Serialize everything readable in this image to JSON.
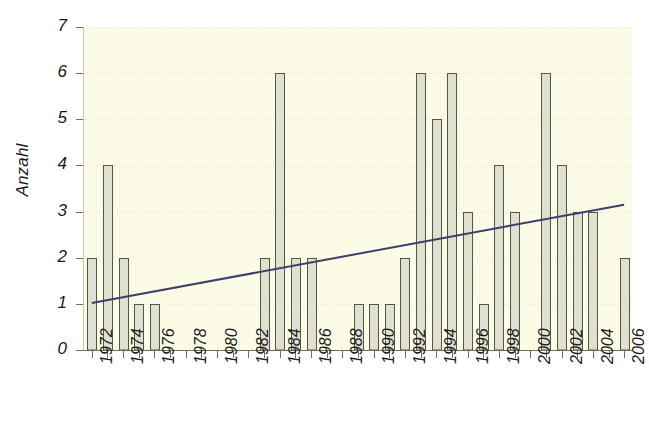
{
  "chart_data": {
    "type": "bar",
    "title": "",
    "subtitle": "",
    "xlabel": "",
    "ylabel": "Anzahl",
    "ylim": [
      0,
      7
    ],
    "xlim": [
      1971.5,
      2006.5
    ],
    "grid": true,
    "legend": false,
    "legend_position": "none",
    "categories": [
      "1972",
      "1973",
      "1974",
      "1975",
      "1976",
      "1977",
      "1978",
      "1979",
      "1980",
      "1981",
      "1982",
      "1983",
      "1984",
      "1985",
      "1986",
      "1987",
      "1988",
      "1989",
      "1990",
      "1991",
      "1992",
      "1993",
      "1994",
      "1995",
      "1996",
      "1997",
      "1998",
      "1999",
      "2000",
      "2001",
      "2002",
      "2003",
      "2004",
      "2005",
      "2006"
    ],
    "values": [
      2,
      4,
      2,
      1,
      1,
      0,
      0,
      0,
      0,
      0,
      0,
      2,
      6,
      2,
      2,
      0,
      0,
      1,
      1,
      1,
      2,
      6,
      5,
      6,
      3,
      1,
      4,
      3,
      0,
      6,
      4,
      3,
      3,
      0,
      2
    ],
    "y_ticks": [
      "0",
      "1",
      "2",
      "3",
      "4",
      "5",
      "6",
      "7"
    ],
    "x_tick_labels": [
      "1972",
      "1974",
      "1976",
      "1978",
      "1980",
      "1982",
      "1984",
      "1986",
      "1988",
      "1990",
      "1992",
      "1994",
      "1996",
      "1998",
      "2000",
      "2002",
      "2004",
      "2006"
    ],
    "series": [
      {
        "name": "Anzahl",
        "type": "bar",
        "values": [
          2,
          4,
          2,
          1,
          1,
          0,
          0,
          0,
          0,
          0,
          0,
          2,
          6,
          2,
          2,
          0,
          0,
          1,
          1,
          1,
          2,
          6,
          5,
          6,
          3,
          1,
          4,
          3,
          0,
          6,
          4,
          3,
          3,
          0,
          2
        ]
      },
      {
        "name": "Trendlinie",
        "type": "line",
        "x_start": 1972,
        "x_end": 2006,
        "y_start": 1.02,
        "y_end": 3.15
      }
    ],
    "colors": {
      "plot_background": "#fbfbe6",
      "bar_fill": "#dfe0d0",
      "bar_border": "#55554a",
      "trendline": "#3f3f6b",
      "gridline": "#e6e2c2",
      "axis": "#6f6f55",
      "text": "#1a1a1a"
    }
  }
}
